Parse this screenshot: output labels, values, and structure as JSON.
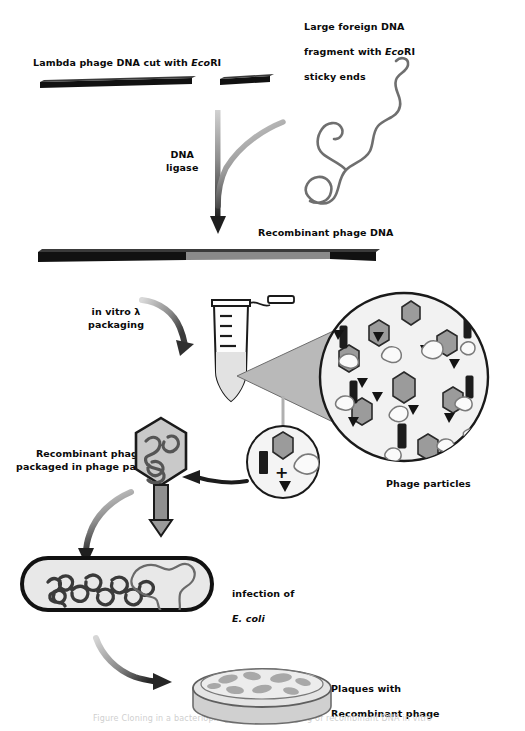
{
  "figure": {
    "type": "biology-process-diagram",
    "bottom_caption": "Figure  Cloning  in  a  bacteriophage  vector:  packaging  of  recombinant  DNA  in  vitro"
  },
  "labels": {
    "lambda_dna": {
      "text_before": "Lambda phage DNA cut with ",
      "italic": "Eco",
      "text_after": "RI"
    },
    "foreign_dna_line1": "Large foreign DNA",
    "foreign_dna_line2_before": "fragment with ",
    "foreign_dna_line2_italic": "Eco",
    "foreign_dna_line2_after": "RI",
    "foreign_dna_line3": "sticky ends",
    "ligase": "DNA\nligase",
    "recombinant_phage_dna": "Recombinant phage DNA",
    "in_vitro_packaging": "in vitro λ\npackaging",
    "phage_particles": "Phage particles",
    "recombinant_packaged": "Recombinant  phage\npackaged in phage particle",
    "infection_line1": "infection of",
    "infection_line2": "E. coli",
    "plaques_line1": "Plaques with",
    "plaques_line2": "Recombinant phage"
  },
  "colors": {
    "dna_black": "#111111",
    "dna_insert_gray": "#8a8a8a",
    "foreign_dna_stroke": "#6f6f6f",
    "arrow_gray": "#8f8f8f",
    "arrow_dark": "#2b2b2b",
    "cone_fill": "#b9b9b9",
    "circle_fill": "#f2f2f2",
    "phage_head_fill": "#9b9b9b",
    "outline": "#1a1a1a",
    "cell_fill": "#e8e8e8",
    "dish_fill": "#dcdcdc",
    "plaque_fill": "#a8a8a8"
  },
  "magnified_circle": {
    "heads": 8,
    "bars": 6,
    "tails": 9,
    "blobs": 10
  },
  "small_circle": {
    "plus_sign": "+",
    "heads": 1,
    "bars": 1,
    "tails": 1,
    "blobs": 1
  },
  "petri_dish": {
    "plaques": 9
  }
}
